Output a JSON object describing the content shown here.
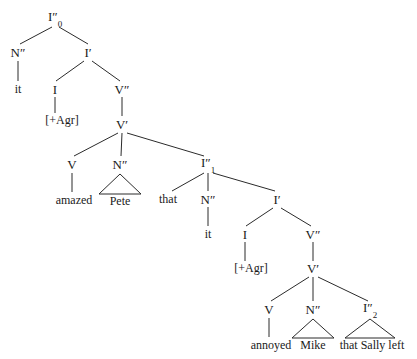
{
  "diagram": {
    "sentence": "it amazed Pete that it annoyed Mike that Sally left",
    "background_color": "#ffffff",
    "line_color": "#2b2b2b",
    "text_color": "#1a1a1a"
  },
  "nodes": [
    {
      "id": "n0",
      "label": "I″",
      "sub": "0",
      "kind": "category",
      "x": 55,
      "y": 18
    },
    {
      "id": "n1",
      "label": "N″",
      "sub": "",
      "kind": "category",
      "x": 18,
      "y": 52
    },
    {
      "id": "n2",
      "label": "I′",
      "sub": "",
      "kind": "category",
      "x": 88,
      "y": 52
    },
    {
      "id": "n3",
      "label": "it",
      "sub": "",
      "kind": "lexical",
      "x": 18,
      "y": 89
    },
    {
      "id": "n4",
      "label": "I",
      "sub": "",
      "kind": "category",
      "x": 55,
      "y": 89
    },
    {
      "id": "n5",
      "label": "V″",
      "sub": "",
      "kind": "category",
      "x": 122,
      "y": 89
    },
    {
      "id": "n6",
      "label": "[+Agr]",
      "sub": "",
      "kind": "feature",
      "x": 62,
      "y": 120
    },
    {
      "id": "n7",
      "label": "V′",
      "sub": "",
      "kind": "category",
      "x": 122,
      "y": 124
    },
    {
      "id": "n8",
      "label": "V",
      "sub": "",
      "kind": "category",
      "x": 72,
      "y": 164
    },
    {
      "id": "n9",
      "label": "N″",
      "sub": "",
      "kind": "category",
      "x": 120,
      "y": 164
    },
    {
      "id": "n10",
      "label": "I″",
      "sub": "1",
      "kind": "category",
      "x": 208,
      "y": 164
    },
    {
      "id": "n11",
      "label": "amazed",
      "sub": "",
      "kind": "lexical",
      "x": 74,
      "y": 200
    },
    {
      "id": "n12",
      "label": "Pete",
      "sub": "",
      "kind": "lexical",
      "x": 120,
      "y": 201
    },
    {
      "id": "n13",
      "label": "that",
      "sub": "",
      "kind": "lexical",
      "x": 168,
      "y": 199
    },
    {
      "id": "n14",
      "label": "N″",
      "sub": "",
      "kind": "category",
      "x": 208,
      "y": 199
    },
    {
      "id": "n15",
      "label": "I′",
      "sub": "",
      "kind": "category",
      "x": 277,
      "y": 199
    },
    {
      "id": "n16",
      "label": "it",
      "sub": "",
      "kind": "lexical",
      "x": 208,
      "y": 234
    },
    {
      "id": "n17",
      "label": "I",
      "sub": "",
      "kind": "category",
      "x": 245,
      "y": 234
    },
    {
      "id": "n18",
      "label": "V″",
      "sub": "",
      "kind": "category",
      "x": 313,
      "y": 234
    },
    {
      "id": "n19",
      "label": "[+Agr]",
      "sub": "",
      "kind": "feature",
      "x": 251,
      "y": 268
    },
    {
      "id": "n20",
      "label": "V′",
      "sub": "",
      "kind": "category",
      "x": 313,
      "y": 268
    },
    {
      "id": "n21",
      "label": "V",
      "sub": "",
      "kind": "category",
      "x": 269,
      "y": 309
    },
    {
      "id": "n22",
      "label": "N″",
      "sub": "",
      "kind": "category",
      "x": 313,
      "y": 309
    },
    {
      "id": "n23",
      "label": "I″",
      "sub": "2",
      "kind": "category",
      "x": 370,
      "y": 309
    },
    {
      "id": "n24",
      "label": "annoyed",
      "sub": "",
      "kind": "lexical",
      "x": 271,
      "y": 345
    },
    {
      "id": "n25",
      "label": "Mike",
      "sub": "",
      "kind": "lexical",
      "x": 313,
      "y": 345
    },
    {
      "id": "n26",
      "label": "that Sally left",
      "sub": "",
      "kind": "lexical",
      "x": 372,
      "y": 345
    }
  ],
  "edges": [
    {
      "from": "n0",
      "to": "n1",
      "x1": 52,
      "y1": 27,
      "x2": 20,
      "y2": 44
    },
    {
      "from": "n0",
      "to": "n2",
      "x1": 59,
      "y1": 27,
      "x2": 88,
      "y2": 44
    },
    {
      "from": "n1",
      "to": "n3",
      "x1": 18,
      "y1": 61,
      "x2": 18,
      "y2": 81
    },
    {
      "from": "n2",
      "to": "n4",
      "x1": 84,
      "y1": 61,
      "x2": 56,
      "y2": 81
    },
    {
      "from": "n2",
      "to": "n5",
      "x1": 92,
      "y1": 61,
      "x2": 120,
      "y2": 81
    },
    {
      "from": "n4",
      "to": "n6",
      "x1": 55,
      "y1": 97,
      "x2": 55,
      "y2": 113
    },
    {
      "from": "n5",
      "to": "n7",
      "x1": 122,
      "y1": 97,
      "x2": 122,
      "y2": 116
    },
    {
      "from": "n7",
      "to": "n8",
      "x1": 118,
      "y1": 133,
      "x2": 74,
      "y2": 156
    },
    {
      "from": "n7",
      "to": "n9",
      "x1": 122,
      "y1": 133,
      "x2": 121,
      "y2": 156
    },
    {
      "from": "n7",
      "to": "n10",
      "x1": 127,
      "y1": 133,
      "x2": 204,
      "y2": 156
    },
    {
      "from": "n8",
      "to": "n11",
      "x1": 72,
      "y1": 173,
      "x2": 72,
      "y2": 192
    },
    {
      "from": "n10",
      "to": "n13",
      "x1": 204,
      "y1": 173,
      "x2": 172,
      "y2": 191
    },
    {
      "from": "n10",
      "to": "n14",
      "x1": 208,
      "y1": 173,
      "x2": 208,
      "y2": 191
    },
    {
      "from": "n10",
      "to": "n15",
      "x1": 213,
      "y1": 173,
      "x2": 275,
      "y2": 191
    },
    {
      "from": "n14",
      "to": "n16",
      "x1": 208,
      "y1": 207,
      "x2": 208,
      "y2": 226
    },
    {
      "from": "n15",
      "to": "n17",
      "x1": 273,
      "y1": 208,
      "x2": 246,
      "y2": 226
    },
    {
      "from": "n15",
      "to": "n18",
      "x1": 281,
      "y1": 208,
      "x2": 311,
      "y2": 226
    },
    {
      "from": "n17",
      "to": "n19",
      "x1": 245,
      "y1": 242,
      "x2": 245,
      "y2": 261
    },
    {
      "from": "n18",
      "to": "n20",
      "x1": 313,
      "y1": 242,
      "x2": 313,
      "y2": 261
    },
    {
      "from": "n20",
      "to": "n21",
      "x1": 309,
      "y1": 277,
      "x2": 271,
      "y2": 301
    },
    {
      "from": "n20",
      "to": "n22",
      "x1": 313,
      "y1": 277,
      "x2": 313,
      "y2": 301
    },
    {
      "from": "n20",
      "to": "n23",
      "x1": 318,
      "y1": 277,
      "x2": 368,
      "y2": 301
    },
    {
      "from": "n21",
      "to": "n24",
      "x1": 269,
      "y1": 318,
      "x2": 269,
      "y2": 337
    }
  ],
  "triangles": [
    {
      "node": "n9",
      "label": "Pete",
      "apex_x": 120,
      "apex_y": 174,
      "base_y": 194,
      "half_width": 21
    },
    {
      "node": "n22",
      "label": "Mike",
      "apex_x": 313,
      "apex_y": 319,
      "base_y": 338,
      "half_width": 21
    },
    {
      "node": "n23",
      "label": "that Sally left",
      "apex_x": 370,
      "apex_y": 319,
      "base_y": 338,
      "half_width": 25
    }
  ]
}
